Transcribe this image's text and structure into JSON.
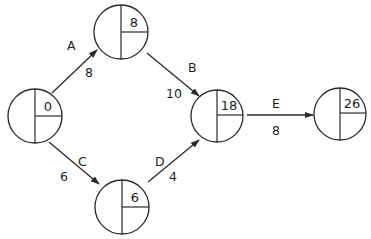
{
  "diagram": {
    "type": "activity-on-arrow network",
    "colors": {
      "line": "#2a2a2a",
      "text": "#1e1e1e",
      "background": "#ffffff"
    },
    "nodes": [
      {
        "id": "n1",
        "earliest_time": "0",
        "cx": 35,
        "cy": 116,
        "r": 27
      },
      {
        "id": "n2",
        "earliest_time": "8",
        "cx": 121,
        "cy": 32,
        "r": 27
      },
      {
        "id": "n3",
        "earliest_time": "6",
        "cx": 122,
        "cy": 207,
        "r": 27
      },
      {
        "id": "n4",
        "earliest_time": "18",
        "cx": 217,
        "cy": 116,
        "r": 26
      },
      {
        "id": "n5",
        "earliest_time": "26",
        "cx": 340,
        "cy": 114,
        "r": 26
      }
    ],
    "edges": [
      {
        "activity": "A",
        "duration": "8",
        "from": "n1",
        "to": "n2"
      },
      {
        "activity": "B",
        "duration": "10",
        "from": "n2",
        "to": "n4"
      },
      {
        "activity": "C",
        "duration": "6",
        "from": "n1",
        "to": "n3"
      },
      {
        "activity": "D",
        "duration": "4",
        "from": "n3",
        "to": "n4"
      },
      {
        "activity": "E",
        "duration": "8",
        "from": "n4",
        "to": "n5"
      }
    ]
  }
}
